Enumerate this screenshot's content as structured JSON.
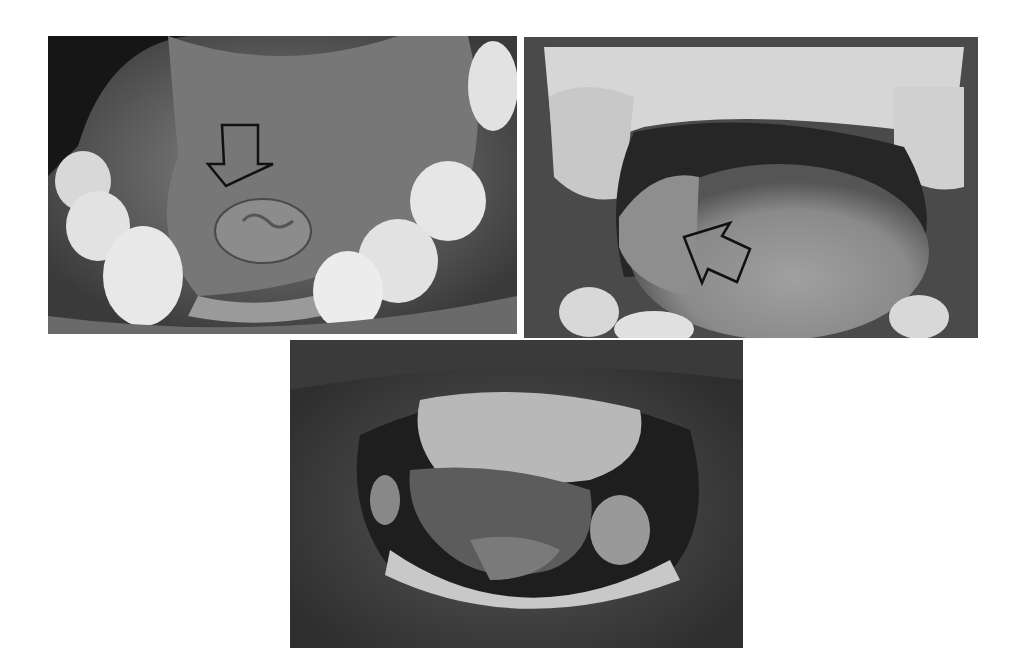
{
  "figure": {
    "panels": [
      {
        "id": "top-left",
        "description": "Open mouth view of floor of mouth with ventral tongue raised; lesion on ventral tongue/floor of mouth",
        "arrow": {
          "present": true,
          "direction": "down",
          "style": "hollow-black"
        }
      },
      {
        "id": "top-right",
        "description": "Open mouth view showing dorsal tongue with lesion on lateral border",
        "arrow": {
          "present": true,
          "direction": "up-left",
          "style": "hollow-black"
        }
      },
      {
        "id": "bottom",
        "description": "Open mouth view with tongue raised showing large exophytic lesion of ventral tongue and floor of mouth",
        "arrow": {
          "present": false
        }
      }
    ],
    "colors": {
      "background": "#ffffff",
      "arrow_stroke": "#111111",
      "tissue_dark": "#2a2a2a",
      "tissue_mid": "#6e6e6e",
      "teeth": "#e6e6e6"
    }
  }
}
